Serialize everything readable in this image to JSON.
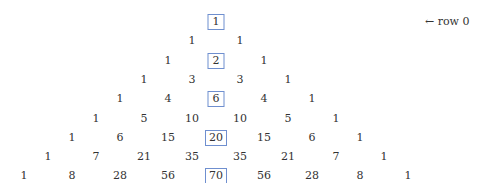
{
  "figure": {
    "type": "pascal-triangle",
    "highlight_color": "#6f8fcf",
    "annotation": {
      "arrow": "←",
      "text": "row 0"
    },
    "rows": [
      [
        1
      ],
      [
        1,
        1
      ],
      [
        1,
        2,
        1
      ],
      [
        1,
        3,
        3,
        1
      ],
      [
        1,
        4,
        6,
        4,
        1
      ],
      [
        1,
        5,
        10,
        10,
        5,
        1
      ],
      [
        1,
        6,
        15,
        20,
        15,
        6,
        1
      ],
      [
        1,
        7,
        21,
        35,
        35,
        21,
        7,
        1
      ],
      [
        1,
        8,
        28,
        56,
        70,
        56,
        28,
        8,
        1
      ]
    ],
    "boxed_central": [
      1,
      2,
      6,
      20,
      70
    ]
  }
}
